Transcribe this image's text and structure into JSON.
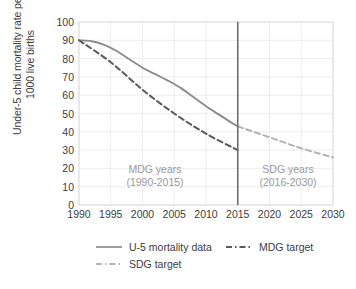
{
  "chart_data": {
    "type": "line",
    "title": "",
    "xlabel": "",
    "ylabel": "Under-5 child mortality rate per 1000 live births",
    "ylabel_line1": "Under-5 child mortality rate per",
    "ylabel_line2": "1000 live births",
    "xlim": [
      1990,
      2030
    ],
    "ylim": [
      0,
      100
    ],
    "grid": true,
    "legend_position": "bottom",
    "x_ticks": [
      1990,
      1995,
      2000,
      2005,
      2010,
      2015,
      2020,
      2025,
      2030
    ],
    "y_ticks": [
      0,
      10,
      20,
      30,
      40,
      50,
      60,
      70,
      80,
      90,
      100
    ],
    "series": [
      {
        "name": "U-5 mortality data",
        "style": "solid",
        "color": "#8c8c8c",
        "x": [
          1990,
          1992,
          1994,
          1996,
          1998,
          2000,
          2002,
          2004,
          2006,
          2008,
          2010,
          2012,
          2014,
          2015
        ],
        "values": [
          90,
          89.5,
          87.5,
          84,
          79.5,
          75,
          71.5,
          68,
          64,
          59,
          54,
          49.5,
          45,
          43
        ]
      },
      {
        "name": "MDG target",
        "style": "dashed",
        "color": "#5a5a5a",
        "x": [
          1990,
          1995,
          2000,
          2005,
          2010,
          2015
        ],
        "values": [
          90,
          78,
          63,
          50,
          39,
          30
        ]
      },
      {
        "name": "SDG target",
        "style": "dashed",
        "color": "#b3b3b3",
        "x": [
          2015,
          2020,
          2025,
          2030
        ],
        "values": [
          43,
          37,
          31,
          26
        ]
      }
    ],
    "divider": {
      "name": "2015-divider",
      "x": 2015,
      "color": "#6e6e6e"
    },
    "annotations": [
      {
        "id": "mdg",
        "line1": "MDG years",
        "line2": "(1990-2015)",
        "color": "#9a9a9a"
      },
      {
        "id": "sdg",
        "line1": "SDG years",
        "line2": "(2016-2030)",
        "color": "#9a9a9a"
      }
    ],
    "legend": [
      {
        "label": "U-5 mortality data",
        "style": "solid",
        "color": "#8c8c8c"
      },
      {
        "label": "MDG target",
        "style": "dashed",
        "color": "#5a5a5a"
      },
      {
        "label": "SDG target",
        "style": "dashed",
        "color": "#b3b3b3"
      }
    ]
  }
}
